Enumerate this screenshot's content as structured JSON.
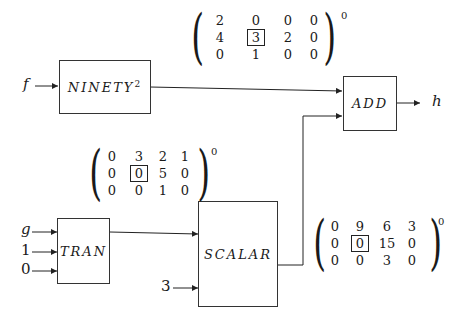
{
  "blocks": {
    "ninety": {
      "name": "NINETY",
      "exponent": "2"
    },
    "add": {
      "name": "ADD"
    },
    "tran": {
      "name": "TRAN"
    },
    "scalar": {
      "name": "SCALAR"
    }
  },
  "inputs": {
    "f": "f",
    "g": "g",
    "one": "1",
    "zero": "0",
    "three": "3"
  },
  "outputs": {
    "h": "h"
  },
  "matrices": {
    "m1": {
      "rows": [
        [
          "2",
          "0",
          "0",
          "0"
        ],
        [
          "4",
          "3",
          "2",
          "0"
        ],
        [
          "0",
          "1",
          "0",
          "0"
        ]
      ],
      "boxed": [
        1,
        1
      ],
      "superscript": "0"
    },
    "m2": {
      "rows": [
        [
          "0",
          "3",
          "2",
          "1"
        ],
        [
          "0",
          "0",
          "5",
          "0"
        ],
        [
          "0",
          "0",
          "1",
          "0"
        ]
      ],
      "boxed": [
        1,
        1
      ],
      "superscript": "0"
    },
    "m3": {
      "rows": [
        [
          "0",
          "9",
          "6",
          "3"
        ],
        [
          "0",
          "0",
          "15",
          "0"
        ],
        [
          "0",
          "0",
          "3",
          "0"
        ]
      ],
      "boxed": [
        1,
        1
      ],
      "superscript": "0"
    }
  }
}
